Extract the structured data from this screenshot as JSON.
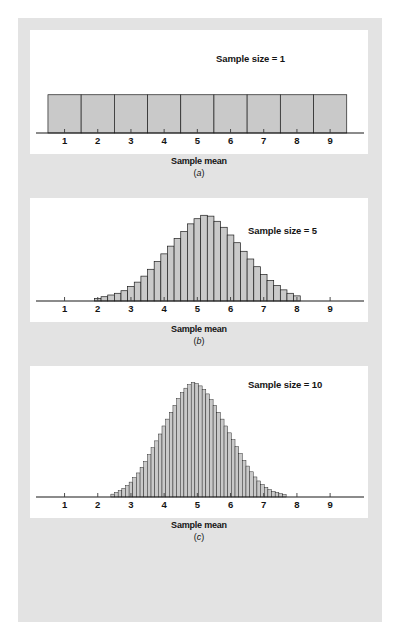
{
  "figure": {
    "background_color": "#e3e3e3",
    "panel_color": "#ffffff",
    "bar_fill_color": "#c9c9c9",
    "bar_stroke_color": "#1d1d1d",
    "axis_color": "#181818"
  },
  "panels": [
    {
      "id": "a",
      "sub_label_open": "(",
      "sub_label_letter": "a",
      "sub_label_close": ")",
      "series_label": "Sample size = 1",
      "axis_title": "Sample mean"
    },
    {
      "id": "b",
      "sub_label_open": "(",
      "sub_label_letter": "b",
      "sub_label_close": ")",
      "series_label": "Sample size = 5",
      "axis_title": "Sample mean"
    },
    {
      "id": "c",
      "sub_label_open": "(",
      "sub_label_letter": "c",
      "sub_label_close": ")",
      "series_label": "Sample size = 10",
      "axis_title": "Sample mean"
    }
  ],
  "chart_data": [
    {
      "type": "bar",
      "title": "Sample size = 1",
      "subtitle": "(a)",
      "xlabel": "Sample mean",
      "ylabel": "",
      "grid": false,
      "legend": "none",
      "xlim": [
        0.2,
        9.9
      ],
      "ylim": [
        0,
        1.15
      ],
      "xticks": [
        1,
        2,
        3,
        4,
        5,
        6,
        7,
        8,
        9
      ],
      "xtick_labels": [
        "1",
        "2",
        "3",
        "4",
        "5",
        "6",
        "7",
        "8",
        "9"
      ],
      "bin_width": 1.0,
      "bin_centers": [
        1,
        2,
        3,
        4,
        5,
        6,
        7,
        8,
        9
      ],
      "values": [
        1,
        1,
        1,
        1,
        1,
        1,
        1,
        1,
        1
      ]
    },
    {
      "type": "bar",
      "title": "Sample size = 5",
      "subtitle": "(b)",
      "xlabel": "Sample mean",
      "ylabel": "",
      "grid": false,
      "legend": "none",
      "xlim": [
        0.2,
        9.9
      ],
      "ylim": [
        0,
        1.12
      ],
      "xticks": [
        1,
        2,
        3,
        4,
        5,
        6,
        7,
        8,
        9
      ],
      "xtick_labels": [
        "1",
        "2",
        "3",
        "4",
        "5",
        "6",
        "7",
        "8",
        "9"
      ],
      "bin_width": 0.2,
      "bin_centers": [
        2.0,
        2.2,
        2.4,
        2.6,
        2.8,
        3.0,
        3.2,
        3.4,
        3.6,
        3.8,
        4.0,
        4.2,
        4.4,
        4.6,
        4.8,
        5.0,
        5.2,
        5.4,
        5.6,
        5.8,
        6.0,
        6.2,
        6.4,
        6.6,
        6.8,
        7.0,
        7.2,
        7.4,
        7.6,
        7.8,
        8.0
      ],
      "values": [
        0.03,
        0.05,
        0.07,
        0.09,
        0.12,
        0.17,
        0.22,
        0.29,
        0.37,
        0.46,
        0.55,
        0.64,
        0.73,
        0.81,
        0.9,
        0.96,
        1.0,
        0.99,
        0.93,
        0.86,
        0.77,
        0.68,
        0.58,
        0.49,
        0.4,
        0.31,
        0.24,
        0.18,
        0.13,
        0.09,
        0.06
      ]
    },
    {
      "type": "bar",
      "title": "Sample size = 10",
      "subtitle": "(c)",
      "xlabel": "Sample mean",
      "ylabel": "",
      "grid": false,
      "legend": "none",
      "xlim": [
        0.2,
        9.9
      ],
      "ylim": [
        0,
        1.1
      ],
      "xticks": [
        1,
        2,
        3,
        4,
        5,
        6,
        7,
        8,
        9
      ],
      "xtick_labels": [
        "1",
        "2",
        "3",
        "4",
        "5",
        "6",
        "7",
        "8",
        "9"
      ],
      "bin_width": 0.11,
      "bin_centers": [
        2.45,
        2.56,
        2.67,
        2.78,
        2.89,
        3.0,
        3.11,
        3.22,
        3.33,
        3.44,
        3.55,
        3.66,
        3.77,
        3.88,
        3.99,
        4.1,
        4.21,
        4.32,
        4.43,
        4.54,
        4.65,
        4.76,
        4.87,
        4.98,
        5.09,
        5.2,
        5.31,
        5.42,
        5.53,
        5.64,
        5.75,
        5.86,
        5.97,
        6.08,
        6.19,
        6.3,
        6.41,
        6.52,
        6.63,
        6.74,
        6.85,
        6.96,
        7.07,
        7.18,
        7.29,
        7.4,
        7.51,
        7.62
      ],
      "values": [
        0.025,
        0.04,
        0.055,
        0.075,
        0.1,
        0.13,
        0.17,
        0.21,
        0.26,
        0.31,
        0.37,
        0.43,
        0.49,
        0.55,
        0.62,
        0.68,
        0.74,
        0.8,
        0.86,
        0.91,
        0.95,
        0.98,
        1.0,
        0.99,
        0.97,
        0.94,
        0.9,
        0.85,
        0.8,
        0.74,
        0.68,
        0.62,
        0.56,
        0.5,
        0.44,
        0.38,
        0.32,
        0.27,
        0.22,
        0.175,
        0.14,
        0.11,
        0.085,
        0.065,
        0.05,
        0.04,
        0.03,
        0.022
      ]
    }
  ]
}
